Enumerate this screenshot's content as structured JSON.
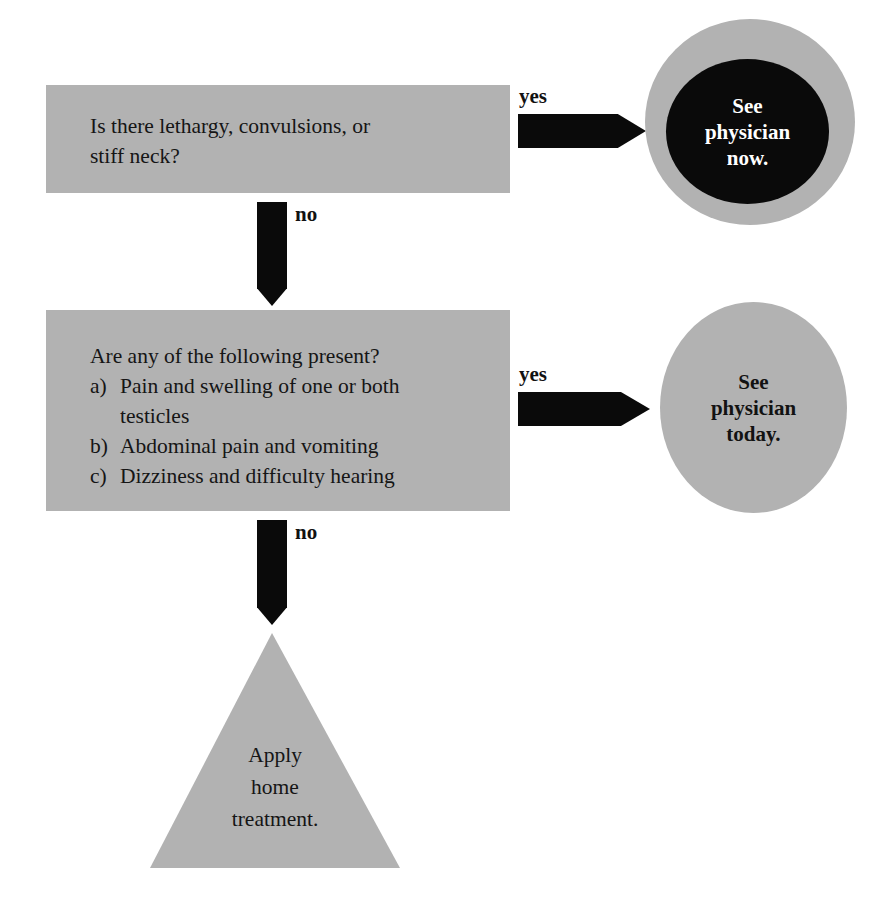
{
  "diagram": {
    "type": "medical-decision-flowchart",
    "colors": {
      "shape_fill": "#b2b2b2",
      "arrow": "#0a0a0a",
      "urgent_fill": "#0a0a0a",
      "urgent_text": "#ffffff",
      "text": "#151515",
      "background": "#ffffff"
    },
    "nodes": {
      "decision_1": {
        "shape": "rectangle",
        "line_1": "Is there lethargy, convulsions, or",
        "line_2": "stiff neck?"
      },
      "decision_2": {
        "shape": "rectangle",
        "prompt": "Are any of the following present?",
        "items": [
          {
            "label": "a)",
            "text": "Pain and swelling of one or both",
            "continuation": "testicles"
          },
          {
            "label": "b)",
            "text": "Abdominal pain and vomiting",
            "continuation": ""
          },
          {
            "label": "c)",
            "text": "Dizziness and difficulty hearing",
            "continuation": ""
          }
        ]
      },
      "outcome_now": {
        "shape": "circle-in-circle",
        "line_1": "See",
        "line_2": "physician",
        "line_3": "now."
      },
      "outcome_today": {
        "shape": "circle",
        "line_1": "See",
        "line_2": "physician",
        "line_3": "today."
      },
      "outcome_home": {
        "shape": "triangle",
        "line_1": "Apply",
        "line_2": "home",
        "line_3": "treatment."
      }
    },
    "edges": {
      "yes_1": "yes",
      "no_1": "no",
      "yes_2": "yes",
      "no_2": "no"
    }
  }
}
